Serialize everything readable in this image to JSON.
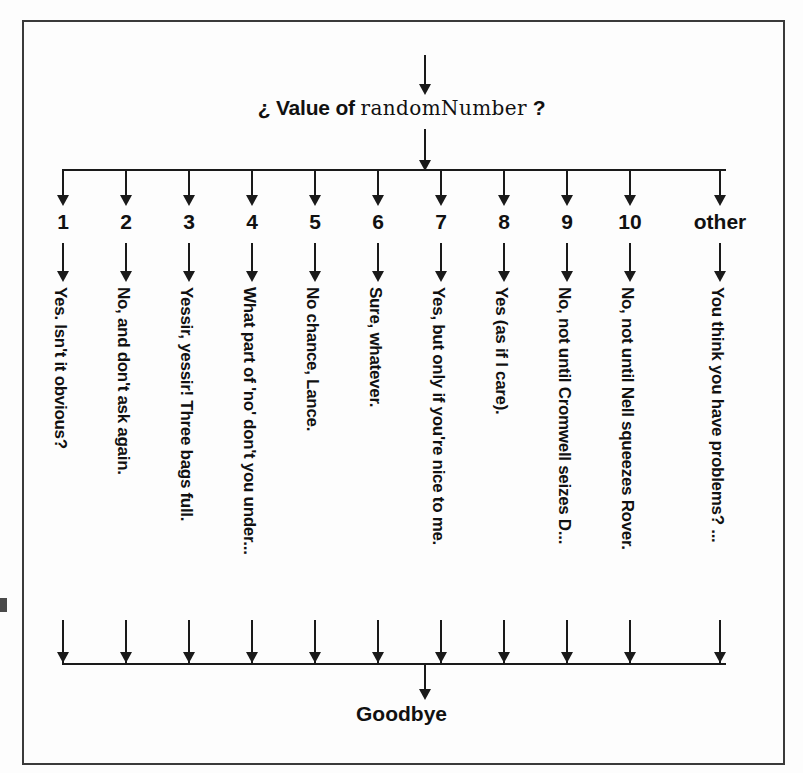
{
  "diagram": {
    "title_prefix": "¿ Value of",
    "title_variable": "randomNumber",
    "title_suffix": "?",
    "end_label": "Goodbye",
    "entry_arrow": "down-arrow",
    "exit_arrow": "down-arrow",
    "branches": [
      {
        "key": "1",
        "answer": "Yes. Isn't it obvious?"
      },
      {
        "key": "2",
        "answer": "No, and don't ask again."
      },
      {
        "key": "3",
        "answer": "Yessir, yessir! Three bags full."
      },
      {
        "key": "4",
        "answer": "What part of 'no' don't you under..."
      },
      {
        "key": "5",
        "answer": "No chance, Lance."
      },
      {
        "key": "6",
        "answer": "Sure, whatever."
      },
      {
        "key": "7",
        "answer": "Yes, but only if you're nice to me."
      },
      {
        "key": "8",
        "answer": "Yes (as if I care)."
      },
      {
        "key": "9",
        "answer": "No, not until Cromwell seizes D..."
      },
      {
        "key": "10",
        "answer": "No, not until Nell squeezes Rover."
      },
      {
        "key": "other",
        "answer": "You think you have problems? ..."
      }
    ],
    "colors": {
      "ink": "#1a1a1a",
      "frame": "#3a3a3a",
      "paper": "#fdfdfd"
    }
  }
}
